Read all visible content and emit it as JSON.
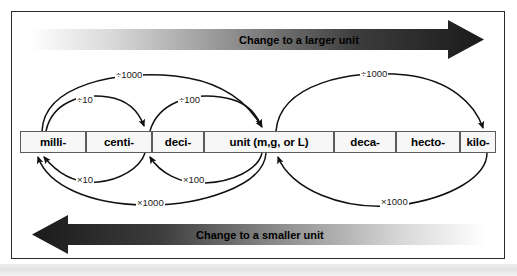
{
  "figure": {
    "background_color": "#ffffff",
    "frame_color": "#2a2a2a"
  },
  "banners": {
    "top": {
      "label": "Change to a larger unit",
      "direction": "right",
      "gradient_from": "#ffffff",
      "gradient_to": "#1c1c1c"
    },
    "bottom": {
      "label": "Change to a smaller unit",
      "direction": "left",
      "gradient_from": "#1c1c1c",
      "gradient_to": "#ffffff"
    }
  },
  "units": [
    {
      "label": "milli-"
    },
    {
      "label": "centi-"
    },
    {
      "label": "deci-"
    },
    {
      "label": "unit (m,g, or L)"
    },
    {
      "label": "deca-"
    },
    {
      "label": "hecto-"
    },
    {
      "label": "kilo-"
    }
  ],
  "arcs": {
    "above": [
      {
        "label": "÷1000",
        "from": "milli-",
        "to": "unit (m,g, or L)"
      },
      {
        "label": "÷10",
        "from": "milli-",
        "to": "centi-"
      },
      {
        "label": "÷100",
        "from": "centi-",
        "to": "unit (m,g, or L)"
      },
      {
        "label": "÷1000",
        "from": "unit (m,g, or L)",
        "to": "kilo-"
      }
    ],
    "below": [
      {
        "label": "×10",
        "from": "centi-",
        "to": "milli-"
      },
      {
        "label": "×100",
        "from": "unit (m,g, or L)",
        "to": "centi-"
      },
      {
        "label": "×1000",
        "from": "unit (m,g, or L)",
        "to": "milli-"
      },
      {
        "label": "×1000",
        "from": "kilo-",
        "to": "unit (m,g, or L)"
      }
    ]
  }
}
